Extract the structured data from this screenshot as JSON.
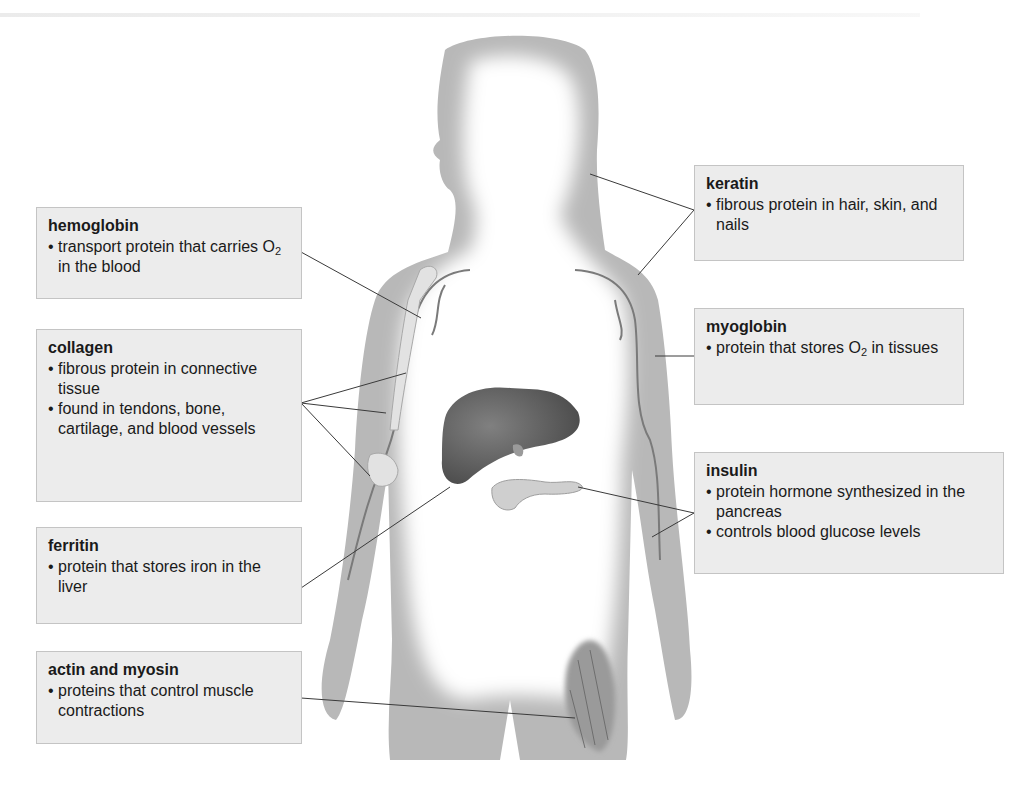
{
  "figure": {
    "organs": [
      "liver",
      "pancreas",
      "arm bones",
      "blood vessels",
      "thigh muscle"
    ]
  },
  "callouts": {
    "hemoglobin": {
      "title": "hemoglobin",
      "bullets": [
        {
          "pre": "transport protein that carries O",
          "sub": "2",
          "post": " in the blood"
        }
      ]
    },
    "collagen": {
      "title": "collagen",
      "bullets": [
        {
          "text": "fibrous protein in connective tissue"
        },
        {
          "text": "found in tendons, bone, cartilage, and blood vessels"
        }
      ]
    },
    "ferritin": {
      "title": "ferritin",
      "bullets": [
        {
          "text": "protein that stores iron in the liver"
        }
      ]
    },
    "actin_myosin": {
      "title": "actin and myosin",
      "bullets": [
        {
          "text": "proteins that control muscle contractions"
        }
      ]
    },
    "keratin": {
      "title": "keratin",
      "bullets": [
        {
          "text": "fibrous protein in hair, skin, and nails"
        }
      ]
    },
    "myoglobin": {
      "title": "myoglobin",
      "bullets": [
        {
          "pre": "protein that stores O",
          "sub": "2",
          "post": " in tissues"
        }
      ]
    },
    "insulin": {
      "title": "insulin",
      "bullets": [
        {
          "text": "protein hormone synthesized in the pancreas"
        },
        {
          "text": "controls blood glucose levels"
        }
      ]
    }
  },
  "colors": {
    "box_fill": "#ececec",
    "box_border": "#c4c4c4",
    "body_shade": "#b5b5b5",
    "liver": "#6a6a6a",
    "leader_line": "#3a3a3a"
  }
}
